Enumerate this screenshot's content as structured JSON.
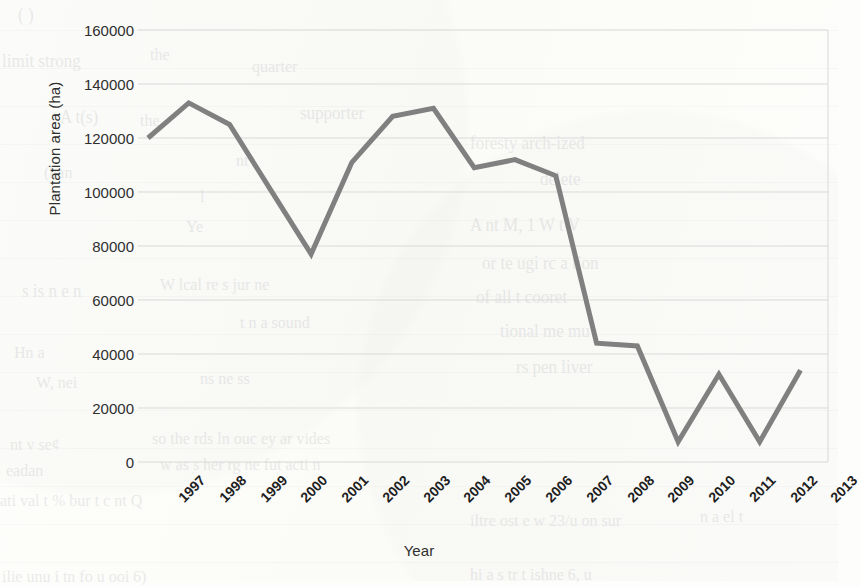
{
  "document": {
    "media": "scanned-page",
    "background_color": "#fdfdfb",
    "ghost_text_color": "#6d7179",
    "bleed_through_lines": [
      {
        "text": "( )",
        "x": 18,
        "y": 6,
        "size": 17
      },
      {
        "text": "limit strong",
        "x": 2,
        "y": 52,
        "size": 17
      },
      {
        "text": "the",
        "x": 150,
        "y": 46,
        "size": 16
      },
      {
        "text": "quarter",
        "x": 252,
        "y": 58,
        "size": 16
      },
      {
        "text": "A t(s)",
        "x": 60,
        "y": 108,
        "size": 17
      },
      {
        "text": "the",
        "x": 140,
        "y": 112,
        "size": 16
      },
      {
        "text": "supporter",
        "x": 300,
        "y": 104,
        "size": 17
      },
      {
        "text": "foresty arch-ized",
        "x": 470,
        "y": 134,
        "size": 17
      },
      {
        "text": "nt",
        "x": 236,
        "y": 152,
        "size": 16
      },
      {
        "text": "delete",
        "x": 540,
        "y": 170,
        "size": 17
      },
      {
        "text": "(han",
        "x": 44,
        "y": 164,
        "size": 16
      },
      {
        "text": "l",
        "x": 200,
        "y": 188,
        "size": 16
      },
      {
        "text": "A  nt  M,  1 W   t  V",
        "x": 470,
        "y": 216,
        "size": 17
      },
      {
        "text": "Ye",
        "x": 186,
        "y": 218,
        "size": 16
      },
      {
        "text": "or   te   ugi  rc a tion",
        "x": 482,
        "y": 254,
        "size": 17
      },
      {
        "text": "s is n e n",
        "x": 22,
        "y": 282,
        "size": 17
      },
      {
        "text": "W  lcal re s  jur   ne",
        "x": 160,
        "y": 276,
        "size": 16
      },
      {
        "text": "of  all t  cooret",
        "x": 476,
        "y": 288,
        "size": 17
      },
      {
        "text": "t  n a  sound",
        "x": 240,
        "y": 314,
        "size": 16
      },
      {
        "text": "tional  me   mu",
        "x": 500,
        "y": 322,
        "size": 17
      },
      {
        "text": "Hn a",
        "x": 14,
        "y": 344,
        "size": 16
      },
      {
        "text": "W,  nei",
        "x": 36,
        "y": 374,
        "size": 16
      },
      {
        "text": "ns  ne ss",
        "x": 200,
        "y": 370,
        "size": 16
      },
      {
        "text": "rs  pen  liver",
        "x": 516,
        "y": 358,
        "size": 17
      },
      {
        "text": "nt  v  se¢",
        "x": 10,
        "y": 436,
        "size": 16
      },
      {
        "text": "so   the rds   ln ouc  ey  ar  vides",
        "x": 152,
        "y": 430,
        "size": 16
      },
      {
        "text": "w  as  s  her  rg  ne  fut  acti n",
        "x": 160,
        "y": 456,
        "size": 16
      },
      {
        "text": "eadan",
        "x": 6,
        "y": 462,
        "size": 16
      },
      {
        "text": "ati   val   t  %  bur   t   c  nt   Q",
        "x": 0,
        "y": 492,
        "size": 16
      },
      {
        "text": "n  a  el   t",
        "x": 700,
        "y": 508,
        "size": 16
      },
      {
        "text": "iltre   ost   e  w  23/u  on   sur",
        "x": 470,
        "y": 512,
        "size": 16
      },
      {
        "text": "ilie  unu  i  tn   fo    u  ooi  6)",
        "x": 2,
        "y": 568,
        "size": 16
      },
      {
        "text": "hi   a    s tr   t   ishne   6,   u",
        "x": 470,
        "y": 566,
        "size": 16
      }
    ],
    "bleed_rule_y": [
      30,
      68,
      106,
      144,
      182,
      220,
      258,
      296,
      334,
      372,
      410,
      448,
      486,
      524,
      562
    ]
  },
  "chart_data": {
    "type": "line",
    "title": "",
    "xlabel": "Year",
    "ylabel": "Plantation area (ha)",
    "categories": [
      "1997",
      "1998",
      "1999",
      "2000",
      "2001",
      "2002",
      "2003",
      "2004",
      "2005",
      "2006",
      "2007",
      "2008",
      "2009",
      "2010",
      "2011",
      "2012",
      "2013"
    ],
    "values": [
      120000,
      133000,
      125000,
      101000,
      77000,
      111000,
      128000,
      131000,
      109000,
      112000,
      106000,
      44000,
      43000,
      7500,
      32500,
      7500,
      34000
    ],
    "series": [
      {
        "name": "Plantation area",
        "color": "#808080",
        "line_width": 5,
        "markers": false,
        "values": [
          120000,
          133000,
          125000,
          101000,
          77000,
          111000,
          128000,
          131000,
          109000,
          112000,
          106000,
          44000,
          43000,
          7500,
          32500,
          7500,
          34000
        ]
      }
    ],
    "ylim": [
      0,
      160000
    ],
    "ytick_step": 20000,
    "yticks": [
      0,
      20000,
      40000,
      60000,
      80000,
      100000,
      120000,
      140000,
      160000
    ],
    "ytick_labels": [
      "0",
      "20000",
      "40000",
      "60000",
      "80000",
      "100000",
      "120000",
      "140000",
      "160000"
    ],
    "grid": {
      "horizontal": true,
      "vertical": false,
      "color": "#d9d9d9"
    },
    "legend": {
      "visible": false,
      "position": "none"
    },
    "xtick_rotation": -45,
    "plot_area": {
      "left": 138,
      "top": 30,
      "right": 828,
      "bottom": 462
    }
  },
  "colors": {
    "line": "#808080",
    "grid": "#d9d9d9",
    "axis_text": "#2f2f2f",
    "tick_text": "#1e1e1e",
    "page": "#fdfdfb"
  }
}
